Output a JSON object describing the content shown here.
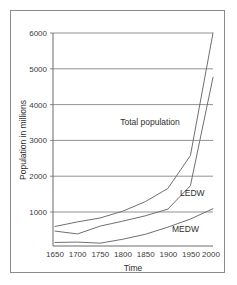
{
  "chart_data": {
    "type": "line",
    "title": "",
    "xlabel": "Time",
    "ylabel": "Population in millions",
    "xlim": [
      1650,
      2000
    ],
    "ylim": [
      0,
      6000
    ],
    "xticks": [
      1650,
      1700,
      1750,
      1800,
      1850,
      1900,
      1950,
      2000
    ],
    "yticks": [
      1000,
      2000,
      3000,
      4000,
      5000,
      6000
    ],
    "grid": "horizontal",
    "legend": "inline-labels",
    "x": [
      1650,
      1700,
      1750,
      1800,
      1850,
      1900,
      1950,
      2000
    ],
    "series": [
      {
        "name": "Total population",
        "label": "Total population",
        "values": [
          550,
          680,
          790,
          980,
          1250,
          1620,
          2550,
          6000
        ]
      },
      {
        "name": "LEDW",
        "label": "LEDW",
        "values": [
          420,
          340,
          560,
          700,
          850,
          1040,
          1700,
          4750
        ]
      },
      {
        "name": "MEDW",
        "label": "MEDW",
        "values": [
          100,
          110,
          80,
          190,
          330,
          530,
          760,
          1050
        ]
      }
    ],
    "annotations": [
      {
        "text": "Total population",
        "x": 1860,
        "y": 3450
      },
      {
        "text": "LEDW",
        "x": 1950,
        "y": 1430
      },
      {
        "text": "MEDW",
        "x": 1925,
        "y": 420
      }
    ]
  },
  "axis": {
    "y_title": "Population in millions",
    "x_title": "Time",
    "y_tick_labels": [
      "6000",
      "5000",
      "4000",
      "3000",
      "2000",
      "1000"
    ],
    "x_tick_labels": [
      "1650",
      "1700",
      "1750",
      "1800",
      "1850",
      "1900",
      "1950",
      "2000"
    ]
  },
  "series_labels": {
    "total": "Total population",
    "ledw": "LEDW",
    "medw": "MEDW"
  },
  "colors": {
    "line": "#707070",
    "grid": "#777777",
    "axis": "#6b6b6b",
    "frame": "#8a8a8a",
    "text": "#2e2e2e",
    "background": "#ffffff"
  }
}
